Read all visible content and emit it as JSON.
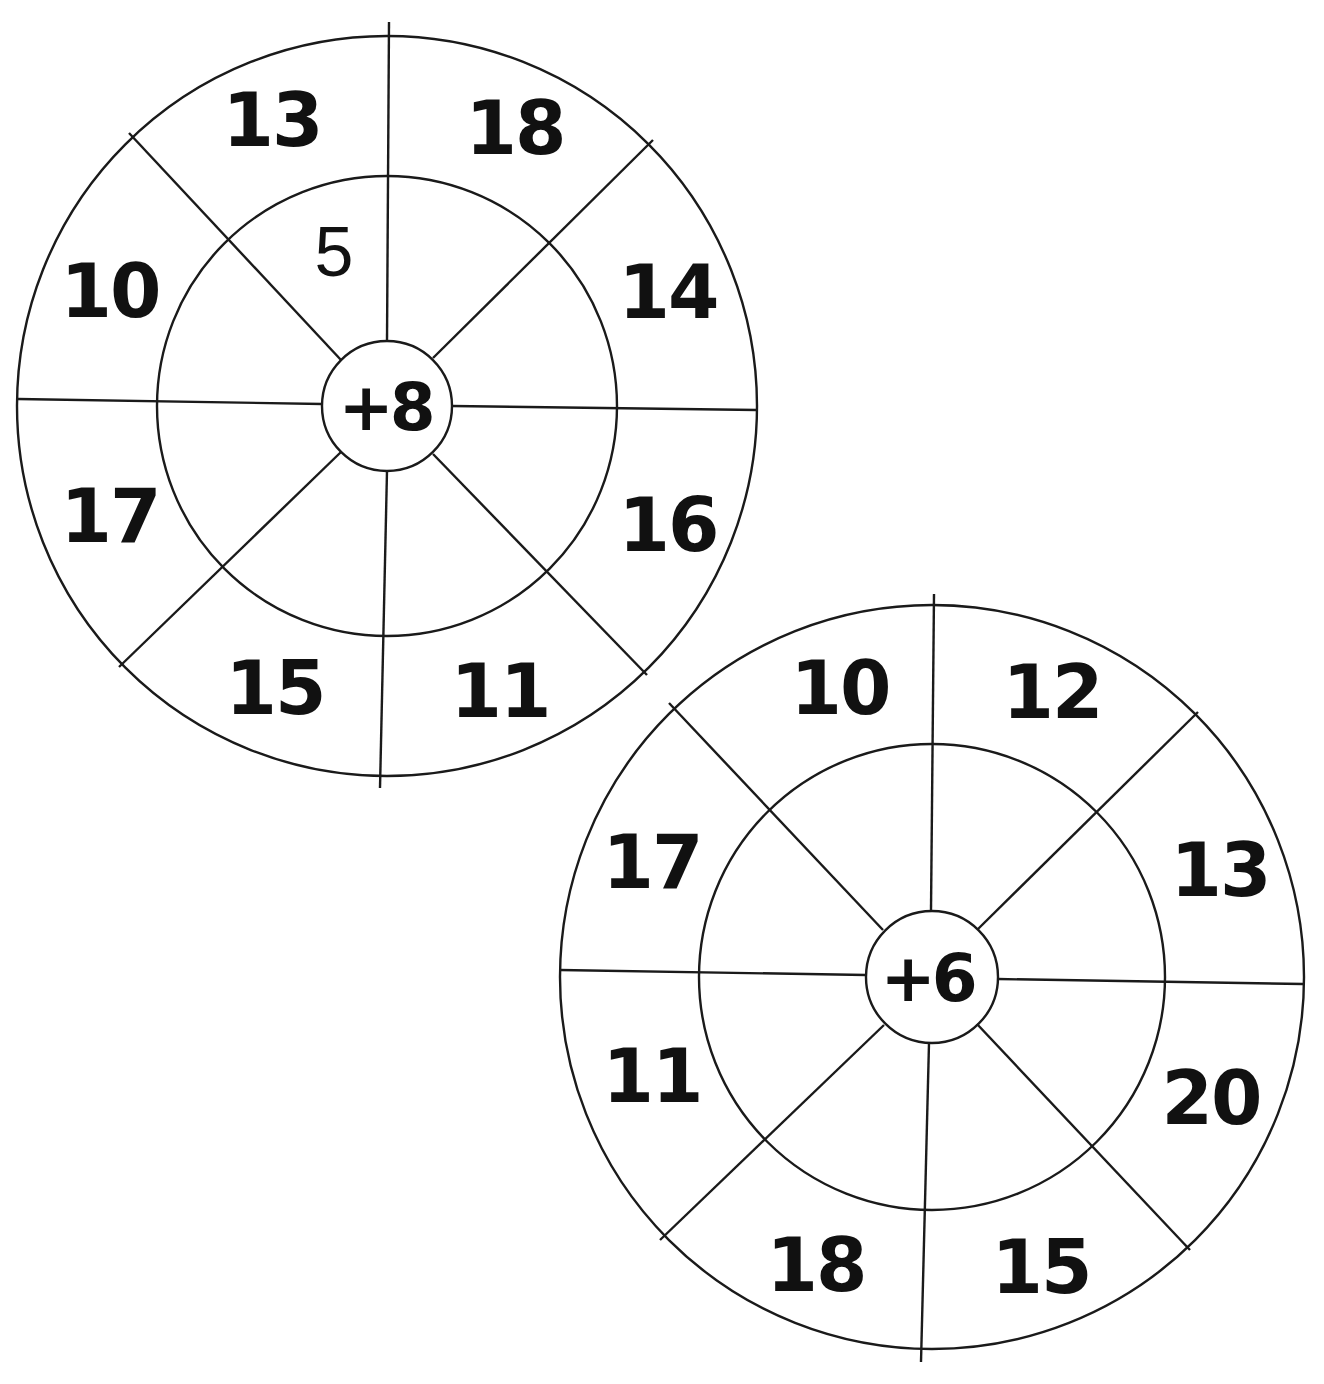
{
  "worksheet": {
    "wheels": [
      {
        "operator": "+8",
        "outer_numbers": [
          "13",
          "18",
          "14",
          "16",
          "11",
          "15",
          "17",
          "10"
        ],
        "inner_answers": [
          "5",
          "",
          "",
          "",
          "",
          "",
          "",
          ""
        ]
      },
      {
        "operator": "+6",
        "outer_numbers": [
          "10",
          "12",
          "13",
          "20",
          "15",
          "18",
          "11",
          "17"
        ],
        "inner_answers": [
          "",
          "",
          "",
          "",
          "",
          "",
          "",
          ""
        ]
      }
    ]
  },
  "colors": {
    "line": "#1a1a1a",
    "text": "#111111",
    "background": "#ffffff"
  }
}
